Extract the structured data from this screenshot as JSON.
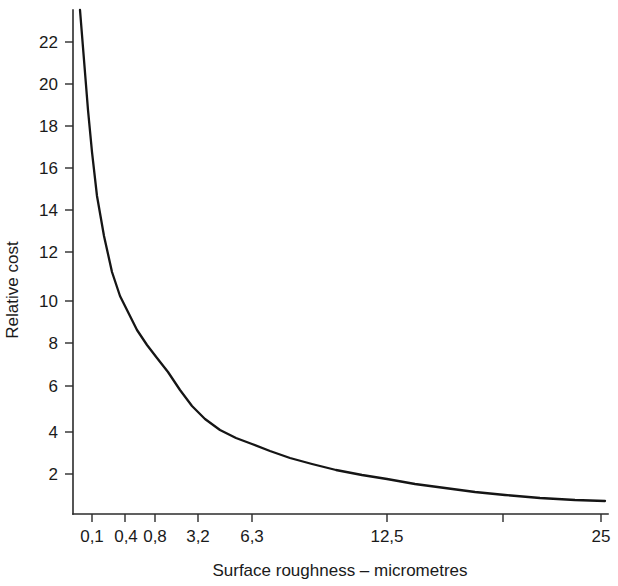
{
  "chart_data": {
    "type": "line",
    "title": "",
    "subtitle": "",
    "xlabel": "Surface roughness – micrometres",
    "ylabel": "Relative cost",
    "grid": false,
    "legend": false,
    "legend_position": "none",
    "x_scale": "non-linear (roughness grade series)",
    "x_tick_labels": [
      "0,1",
      "0,4",
      "0,8",
      "3,2",
      "6,3",
      "12,5",
      "",
      "25"
    ],
    "x_tick_positions_px": [
      92,
      125,
      155,
      198,
      252,
      387,
      503,
      601
    ],
    "y_tick_labels": [
      "2",
      "4",
      "6",
      "8",
      "10",
      "12",
      "14",
      "16",
      "18",
      "20",
      "22"
    ],
    "y_values_ticks": [
      2,
      4,
      6,
      8,
      10,
      12,
      14,
      16,
      18,
      20,
      22
    ],
    "ylim": [
      0,
      23.2
    ],
    "xlim_px": [
      73,
      608
    ],
    "series": [
      {
        "name": "Relative cost vs surface roughness",
        "x_labels": [
          "0,1",
          "0,4",
          "0,8",
          "3,2",
          "6,3",
          "12,5",
          "25"
        ],
        "x_px": [
          80,
          125,
          155,
          198,
          252,
          387,
          601
        ],
        "values": [
          23.2,
          10.3,
          7.7,
          4.7,
          3.5,
          1.8,
          0.45
        ],
        "points_px": [
          [
            80,
            10
          ],
          [
            84,
            60
          ],
          [
            88,
            110
          ],
          [
            92,
            152
          ],
          [
            97,
            196
          ],
          [
            104,
            236
          ],
          [
            112,
            272
          ],
          [
            120,
            296
          ],
          [
            128,
            312
          ],
          [
            137,
            330
          ],
          [
            147,
            345
          ],
          [
            157,
            358
          ],
          [
            168,
            372
          ],
          [
            180,
            390
          ],
          [
            192,
            406
          ],
          [
            205,
            419
          ],
          [
            220,
            430
          ],
          [
            236,
            438
          ],
          [
            252,
            444
          ],
          [
            270,
            451
          ],
          [
            290,
            458
          ],
          [
            312,
            464
          ],
          [
            336,
            470
          ],
          [
            362,
            475
          ],
          [
            387,
            479
          ],
          [
            415,
            484
          ],
          [
            445,
            488
          ],
          [
            475,
            492
          ],
          [
            505,
            495
          ],
          [
            540,
            498
          ],
          [
            575,
            500
          ],
          [
            605,
            501
          ]
        ]
      }
    ]
  },
  "colors": {
    "background": "#ffffff",
    "curve": "#151515",
    "axis": "#2b2b2b",
    "text": "#1a1a1a"
  }
}
